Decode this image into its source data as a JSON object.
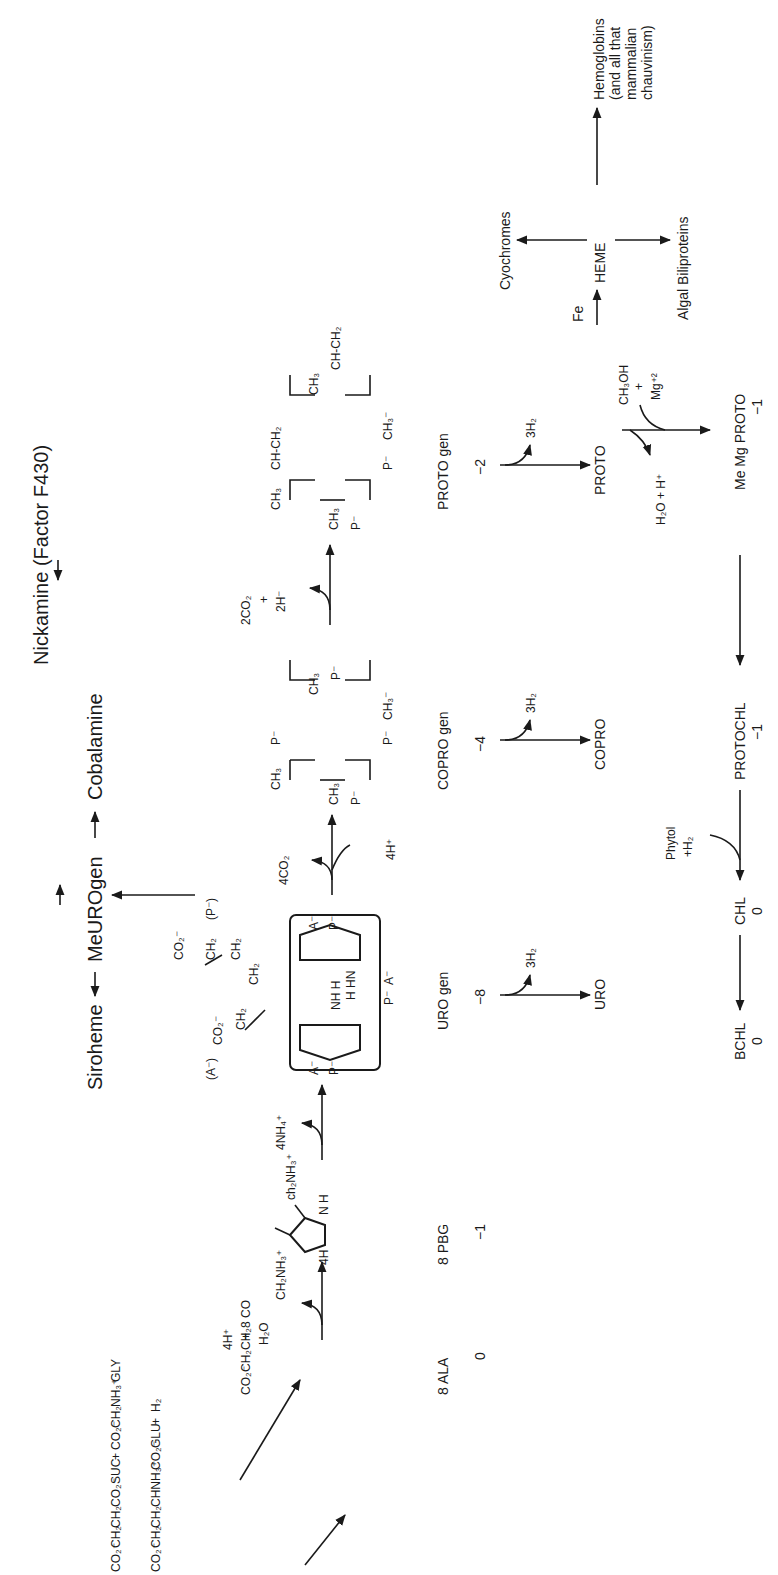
{
  "diagram": {
    "type": "biochemical-pathway",
    "orientation": "rotated-90-ccw",
    "branch_top": {
      "nickamine": "Nickamine (Factor F430)",
      "siroheme": "Siroheme",
      "meurogen": "MeUROgen",
      "cobalamine": "Cobalamine"
    },
    "precursors": {
      "suc": [
        "CO₂⁻",
        "CH₂",
        "CH₂",
        "CO₂⁻",
        "SUC"
      ],
      "plus1": "+",
      "gly": [
        "CO₂⁻",
        "CH₂",
        "NH₃⁺",
        "GLY"
      ],
      "glu": [
        "CO₂⁻",
        "CH₂",
        "CH₂",
        "CHNH₃⁺",
        "CO₂⁻",
        "GLU"
      ],
      "plus2": "+",
      "h2": "H₂"
    },
    "ala": {
      "formula": [
        "CO₂⁻",
        "CH₂",
        "CH₂",
        "8 CO",
        "CH₂",
        "NH₃⁺"
      ],
      "label": "8 ALA",
      "charge": "0"
    },
    "step1_byproduct": [
      "4H⁺",
      "+",
      "H₂O"
    ],
    "pbg": {
      "label": "8 PBG",
      "charge": "−1",
      "substituent": "ch₂NH₃⁺",
      "prefix": "4H",
      "nh": "N H"
    },
    "step2_byproduct": "4NH₄⁺",
    "urogen": {
      "label": "URO gen",
      "charge": "−8",
      "labels": [
        "(A⁻)",
        "CO₂⁻",
        "CH₂",
        "CH₂",
        "CO₂⁻",
        "CH₂",
        "(P⁻)",
        "CH₂",
        "A⁻",
        "P⁻",
        "A⁻",
        "P⁻",
        "P⁻",
        "A⁻"
      ],
      "byproduct": "3H₂",
      "product": "URO"
    },
    "step3": {
      "out": "4CO₂",
      "in": "4H⁺"
    },
    "coprogen": {
      "label": "COPRO gen",
      "charge": "−4",
      "labels": [
        "CH₃",
        "P⁻",
        "CH₃",
        "P⁻",
        "CH₃",
        "P⁻",
        "P⁻",
        "CH₃⁻"
      ],
      "byproduct": "3H₂",
      "product": "COPRO"
    },
    "step4": {
      "out": [
        "2CO₂",
        "+",
        "2H⁻"
      ]
    },
    "protogen": {
      "label": "PROTO gen",
      "charge": "−2",
      "labels": [
        "CH₃",
        "CH-CH₂",
        "CH₃",
        "CH₃",
        "CH-CH₂",
        "P⁻",
        "P⁻",
        "CH₃⁻"
      ],
      "byproduct": "3H₂",
      "product": "PROTO"
    },
    "proto_branch": {
      "in": [
        "CH₃OH",
        "+",
        "Mg⁺²"
      ],
      "out": "H₂O + H⁺",
      "mgproto": "Me Mg PROTO",
      "mgproto_charge": "−1",
      "fe": "Fe",
      "heme": "HEME",
      "cytochromes": "Cyochromes",
      "hemoglobins": [
        "Hemoglobins",
        "(and all that",
        "mammalian",
        "chauvinism)"
      ],
      "biliproteins": "Algal Biliproteins"
    },
    "chlorophyll_branch": {
      "protochl": "PROTOCHL",
      "protochl_charge": "−1",
      "phytol": [
        "Phytol",
        "+H₂"
      ],
      "chl": "CHL",
      "chl_charge": "0",
      "bchl": "BCHL",
      "bchl_charge": "0"
    },
    "colors": {
      "ink": "#1a1a1a",
      "background": "#ffffff"
    }
  }
}
